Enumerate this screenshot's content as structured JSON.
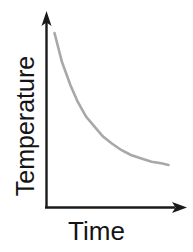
{
  "figure": {
    "title": "",
    "background_color": "#ffffff",
    "axis_color": "#1a1a1a",
    "curve_color": "#a8a8a8"
  },
  "labels": {
    "y_axis": "Temperature",
    "x_axis": "Time"
  },
  "icons": {
    "y_axis_arrow": "arrow-up-icon",
    "x_axis_arrow": "arrow-right-icon"
  },
  "chart_data": {
    "type": "line",
    "title": "",
    "subtitle": "",
    "xlabel": "Time",
    "ylabel": "Temperature",
    "xlim": [
      0,
      1
    ],
    "ylim": [
      0,
      1
    ],
    "grid": false,
    "legend": "none",
    "ticks": {
      "x": [],
      "y": []
    },
    "annotations": [],
    "series": [
      {
        "name": "Cooling curve",
        "description": "Exponential decay of temperature over time",
        "x": [
          0.06,
          0.12,
          0.19,
          0.25,
          0.32,
          0.39,
          0.46,
          0.53,
          0.61,
          0.69,
          0.77,
          0.86,
          0.94,
          1.0
        ],
        "y": [
          1.0,
          0.83,
          0.69,
          0.59,
          0.5,
          0.44,
          0.38,
          0.34,
          0.3,
          0.27,
          0.25,
          0.23,
          0.22,
          0.21
        ]
      }
    ]
  }
}
